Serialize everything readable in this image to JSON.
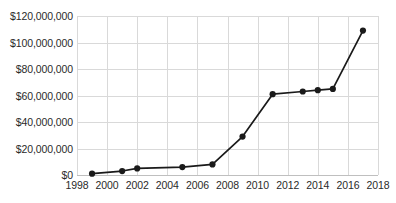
{
  "chart_data": {
    "type": "line",
    "title": "",
    "subtitle": "",
    "xlabel": "",
    "ylabel": "",
    "xlim": [
      1998,
      2018
    ],
    "ylim": [
      0,
      120000000
    ],
    "grid": true,
    "legend": false,
    "legend_position": "none",
    "x_tick_labels": [
      "1998",
      "2000",
      "2002",
      "2004",
      "2006",
      "2008",
      "2010",
      "2012",
      "2014",
      "2016",
      "2018"
    ],
    "x_ticks": [
      1998,
      2000,
      2002,
      2004,
      2006,
      2008,
      2010,
      2012,
      2014,
      2016,
      2018
    ],
    "y_tick_labels": [
      "$0",
      "$20,000,000",
      "$40,000,000",
      "$60,000,000",
      "$80,000,000",
      "$100,000,000",
      "$120,000,000"
    ],
    "y_ticks": [
      0,
      20000000,
      40000000,
      60000000,
      80000000,
      100000000,
      120000000
    ],
    "series": [
      {
        "name": "",
        "color": "#1a1a1a",
        "marker": "circle",
        "x": [
          1999,
          2001,
          2002,
          2005,
          2007,
          2009,
          2011,
          2013,
          2014,
          2015,
          2017
        ],
        "values": [
          1000000,
          3000000,
          5000000,
          6000000,
          8000000,
          29000000,
          61000000,
          63000000,
          64000000,
          65000000,
          109000000
        ]
      }
    ]
  },
  "style": {
    "grid_color": "#d9d9d9",
    "axis_color": "#bfbfbf",
    "text_color": "#2a2a2a",
    "background": "#ffffff",
    "series_color": "#1a1a1a"
  }
}
